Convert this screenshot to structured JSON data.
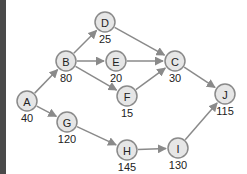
{
  "diagram": {
    "type": "directed-network",
    "colors": {
      "node_fill": "#e6e6e6",
      "node_stroke": "#8a8a8a",
      "edge": "#8a8a8a",
      "text": "#222222",
      "left_bar": "#4a4a4a"
    },
    "nodes": [
      {
        "id": "A",
        "label": "A",
        "value": "40",
        "x": 27,
        "y": 101
      },
      {
        "id": "B",
        "label": "B",
        "value": "80",
        "x": 66,
        "y": 61
      },
      {
        "id": "D",
        "label": "D",
        "value": "25",
        "x": 105,
        "y": 22
      },
      {
        "id": "E",
        "label": "E",
        "value": "20",
        "x": 116,
        "y": 61
      },
      {
        "id": "C",
        "label": "C",
        "value": "30",
        "x": 175,
        "y": 61
      },
      {
        "id": "F",
        "label": "F",
        "value": "15",
        "x": 127,
        "y": 96
      },
      {
        "id": "G",
        "label": "G",
        "value": "120",
        "x": 67,
        "y": 122
      },
      {
        "id": "H",
        "label": "H",
        "value": "145",
        "x": 127,
        "y": 150
      },
      {
        "id": "I",
        "label": "I",
        "value": "130",
        "x": 178,
        "y": 148
      },
      {
        "id": "J",
        "label": "J",
        "value": "115",
        "x": 225,
        "y": 94
      }
    ],
    "edges": [
      {
        "from": "A",
        "to": "B"
      },
      {
        "from": "A",
        "to": "G"
      },
      {
        "from": "B",
        "to": "D"
      },
      {
        "from": "B",
        "to": "E"
      },
      {
        "from": "B",
        "to": "F"
      },
      {
        "from": "D",
        "to": "C"
      },
      {
        "from": "E",
        "to": "C"
      },
      {
        "from": "F",
        "to": "C"
      },
      {
        "from": "C",
        "to": "J"
      },
      {
        "from": "G",
        "to": "H"
      },
      {
        "from": "H",
        "to": "I"
      },
      {
        "from": "I",
        "to": "J"
      }
    ]
  }
}
